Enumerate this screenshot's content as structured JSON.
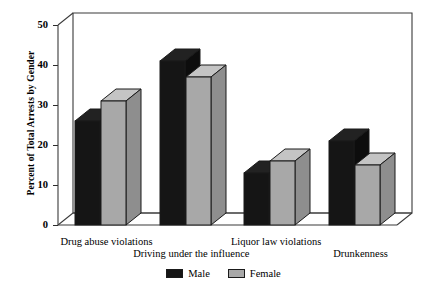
{
  "chart_data": {
    "type": "bar",
    "title": "",
    "subtitle": "",
    "xlabel": "",
    "ylabel": "Percent of Total Arrests by Gender",
    "ylim": [
      0,
      50
    ],
    "yticks": [
      0,
      10,
      20,
      30,
      40,
      50
    ],
    "ytick_labels": [
      "0",
      "10",
      "20",
      "30",
      "40",
      "50"
    ],
    "grid": false,
    "legend_position": "bottom-center",
    "three_d": true,
    "categories": [
      "Drug abuse violations",
      "Driving under the influence",
      "Liquor law violations",
      "Drunkenness"
    ],
    "series": [
      {
        "name": "Male",
        "color": "#151515",
        "values": [
          26,
          41,
          13,
          21
        ]
      },
      {
        "name": "Female",
        "color": "#a8a8a8",
        "values": [
          31,
          37,
          16,
          15
        ]
      }
    ]
  },
  "legend": {
    "items": [
      {
        "label": "Male",
        "swatch": "male-swatch"
      },
      {
        "label": "Female",
        "swatch": "female-swatch"
      }
    ]
  }
}
